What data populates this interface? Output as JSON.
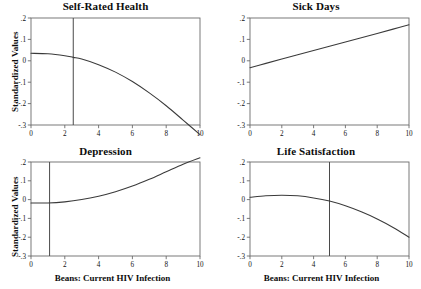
{
  "figure": {
    "background_color": "#ffffff",
    "line_color": "#3a3a3a",
    "axis_color": "#6b6b6b",
    "ref_line_color": "#4a4a4a",
    "shared_ylabel": "Standardized Values",
    "shared_xlabel": "Beans: Current HIV Infection"
  },
  "chart_data": [
    {
      "type": "line",
      "panel": "top-left",
      "title": "Self-Rated Health",
      "xlabel": "",
      "ylabel": "Standardized Values",
      "xlim": [
        0,
        10
      ],
      "ylim": [
        -0.3,
        0.2
      ],
      "xticks": [
        0,
        2,
        4,
        6,
        8,
        10
      ],
      "xtick_labels": [
        "0",
        "2",
        "4",
        "6",
        "8",
        "10"
      ],
      "yticks": [
        0.2,
        0.1,
        0,
        -0.1,
        -0.2,
        -0.3
      ],
      "ytick_labels": [
        ".2",
        ".1",
        "0",
        "-.1",
        "-.2",
        "-.3"
      ],
      "grid": false,
      "legend": "none",
      "reference_line_x": 2.5,
      "x": [
        0,
        1,
        2,
        2.5,
        3,
        4,
        5,
        6,
        7,
        8,
        9,
        10
      ],
      "y": [
        0.035,
        0.033,
        0.024,
        0.016,
        0.008,
        -0.018,
        -0.053,
        -0.097,
        -0.15,
        -0.21,
        -0.277,
        -0.345
      ]
    },
    {
      "type": "line",
      "panel": "top-right",
      "title": "Sick Days",
      "xlabel": "",
      "ylabel": "",
      "xlim": [
        0,
        10
      ],
      "ylim": [
        -0.3,
        0.2
      ],
      "xticks": [
        0,
        2,
        4,
        6,
        8,
        10
      ],
      "xtick_labels": [
        "0",
        "2",
        "4",
        "6",
        "8",
        "10"
      ],
      "yticks": [
        0.2,
        0.1,
        0,
        -0.1,
        -0.2,
        -0.3
      ],
      "ytick_labels": [
        ".2",
        ".1",
        "0",
        "-.1",
        "-.2",
        "-.3"
      ],
      "grid": false,
      "legend": "none",
      "reference_line_x": null,
      "x": [
        0,
        1,
        2,
        3,
        4,
        5,
        6,
        7,
        8,
        9,
        10
      ],
      "y": [
        -0.032,
        -0.012,
        0.008,
        0.028,
        0.048,
        0.068,
        0.088,
        0.108,
        0.128,
        0.148,
        0.168
      ]
    },
    {
      "type": "line",
      "panel": "bottom-left",
      "title": "Depression",
      "xlabel": "Beans: Current HIV Infection",
      "ylabel": "Standardized Values",
      "xlim": [
        0,
        10
      ],
      "ylim": [
        -0.3,
        0.2
      ],
      "xticks": [
        0,
        2,
        4,
        6,
        8,
        10
      ],
      "xtick_labels": [
        "0",
        "2",
        "4",
        "6",
        "8",
        "10"
      ],
      "yticks": [
        0.2,
        0.1,
        0,
        -0.1,
        -0.2,
        -0.3
      ],
      "ytick_labels": [
        ".2",
        ".1",
        "0",
        "-.1",
        "-.2",
        "-.3"
      ],
      "grid": false,
      "legend": "none",
      "reference_line_x": 1.1,
      "x": [
        0,
        1,
        2,
        3,
        4,
        5,
        6,
        7,
        8,
        9,
        10
      ],
      "y": [
        -0.018,
        -0.018,
        -0.012,
        0.0,
        0.018,
        0.042,
        0.072,
        0.108,
        0.148,
        0.188,
        0.222
      ]
    },
    {
      "type": "line",
      "panel": "bottom-right",
      "title": "Life Satisfaction",
      "xlabel": "Beans: Current HIV Infection",
      "ylabel": "",
      "xlim": [
        0,
        10
      ],
      "ylim": [
        -0.3,
        0.2
      ],
      "xticks": [
        0,
        2,
        4,
        6,
        8,
        10
      ],
      "xtick_labels": [
        "0",
        "2",
        "4",
        "6",
        "8",
        "10"
      ],
      "yticks": [
        0.2,
        0.1,
        0,
        -0.1,
        -0.2,
        -0.3
      ],
      "ytick_labels": [
        ".2",
        ".1",
        "0",
        "-.1",
        "-.2",
        "-.3"
      ],
      "grid": false,
      "legend": "none",
      "reference_line_x": 5.0,
      "x": [
        0,
        1,
        2,
        3,
        4,
        5,
        6,
        7,
        8,
        9,
        10
      ],
      "y": [
        0.012,
        0.02,
        0.023,
        0.02,
        0.009,
        -0.008,
        -0.033,
        -0.065,
        -0.103,
        -0.148,
        -0.2
      ]
    }
  ]
}
